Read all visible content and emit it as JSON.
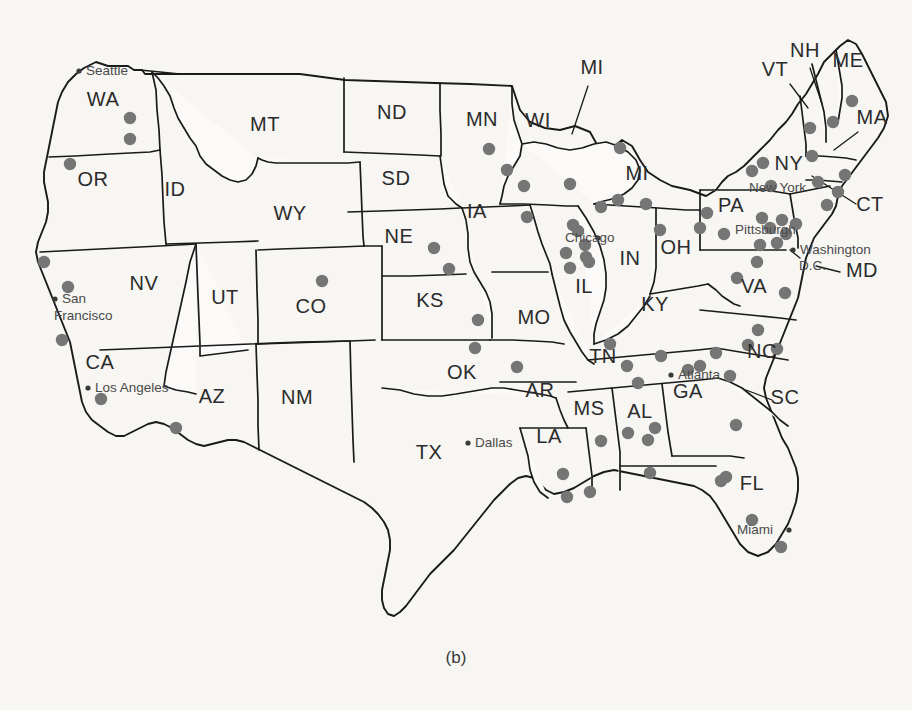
{
  "figure": {
    "caption": "(b)",
    "background_color": "#f7f6f3",
    "dot_color": "#757575",
    "outline_color": "#1a1a1a"
  },
  "map": {
    "title": "United States state map with sample site markers",
    "state_labels": [
      {
        "code": "WA",
        "x": 103,
        "y": 106
      },
      {
        "code": "OR",
        "x": 93,
        "y": 186
      },
      {
        "code": "ID",
        "x": 175,
        "y": 196
      },
      {
        "code": "MT",
        "x": 265,
        "y": 131
      },
      {
        "code": "ND",
        "x": 392,
        "y": 119
      },
      {
        "code": "SD",
        "x": 396,
        "y": 185
      },
      {
        "code": "NE",
        "x": 399,
        "y": 243
      },
      {
        "code": "WY",
        "x": 290,
        "y": 220
      },
      {
        "code": "CO",
        "x": 311,
        "y": 313
      },
      {
        "code": "UT",
        "x": 225,
        "y": 304
      },
      {
        "code": "NV",
        "x": 144,
        "y": 290
      },
      {
        "code": "CA",
        "x": 100,
        "y": 369
      },
      {
        "code": "AZ",
        "x": 212,
        "y": 403
      },
      {
        "code": "NM",
        "x": 297,
        "y": 404
      },
      {
        "code": "TX",
        "x": 429,
        "y": 459
      },
      {
        "code": "OK",
        "x": 462,
        "y": 379
      },
      {
        "code": "KS",
        "x": 430,
        "y": 307
      },
      {
        "code": "MN",
        "x": 482,
        "y": 126
      },
      {
        "code": "IA",
        "x": 477,
        "y": 218
      },
      {
        "code": "MO",
        "x": 534,
        "y": 324
      },
      {
        "code": "AR",
        "x": 540,
        "y": 397
      },
      {
        "code": "LA",
        "x": 549,
        "y": 443
      },
      {
        "code": "MS",
        "x": 589,
        "y": 415
      },
      {
        "code": "AL",
        "x": 640,
        "y": 418
      },
      {
        "code": "WI",
        "x": 538,
        "y": 127
      },
      {
        "code": "IL",
        "x": 584,
        "y": 293
      },
      {
        "code": "MI",
        "x": 592,
        "y": 74
      },
      {
        "code": "MI",
        "x": 637,
        "y": 180
      },
      {
        "code": "IN",
        "x": 630,
        "y": 265
      },
      {
        "code": "OH",
        "x": 676,
        "y": 254
      },
      {
        "code": "KY",
        "x": 655,
        "y": 311
      },
      {
        "code": "TN",
        "x": 603,
        "y": 363
      },
      {
        "code": "GA",
        "x": 688,
        "y": 398
      },
      {
        "code": "FL",
        "x": 752,
        "y": 490
      },
      {
        "code": "SC",
        "x": 785,
        "y": 404
      },
      {
        "code": "NC",
        "x": 762,
        "y": 358
      },
      {
        "code": "VA",
        "x": 754,
        "y": 293
      },
      {
        "code": "PA",
        "x": 731,
        "y": 212
      },
      {
        "code": "NY",
        "x": 789,
        "y": 170
      },
      {
        "code": "VT",
        "x": 775,
        "y": 76
      },
      {
        "code": "NH",
        "x": 805,
        "y": 57
      },
      {
        "code": "ME",
        "x": 848,
        "y": 67
      },
      {
        "code": "MA",
        "x": 872,
        "y": 124
      },
      {
        "code": "CT",
        "x": 870,
        "y": 211
      },
      {
        "code": "MD",
        "x": 862,
        "y": 277
      }
    ],
    "cities": [
      {
        "name": "Seattle",
        "label_x": 86,
        "label_y": 75,
        "anchor": "start",
        "dot_x": 79,
        "dot_y": 71
      },
      {
        "name": "San",
        "label_x": 62,
        "label_y": 303,
        "anchor": "start",
        "dot_x": 55,
        "dot_y": 299
      },
      {
        "name": "Francisco",
        "label_x": 54,
        "label_y": 320,
        "anchor": "start",
        "dot_x": null,
        "dot_y": null
      },
      {
        "name": "Los Angeles",
        "label_x": 95,
        "label_y": 392,
        "anchor": "start",
        "dot_x": 88,
        "dot_y": 388
      },
      {
        "name": "Dallas",
        "label_x": 475,
        "label_y": 447,
        "anchor": "start",
        "dot_x": 468,
        "dot_y": 443
      },
      {
        "name": "Chicago",
        "label_x": 565,
        "label_y": 242,
        "anchor": "start",
        "dot_x": 598,
        "dot_y": 238
      },
      {
        "name": "Atlanta",
        "label_x": 678,
        "label_y": 379,
        "anchor": "start",
        "dot_x": 671,
        "dot_y": 375
      },
      {
        "name": "Miami",
        "label_x": 737,
        "label_y": 534,
        "anchor": "start",
        "dot_x": 789,
        "dot_y": 530
      },
      {
        "name": "New York",
        "label_x": 749,
        "label_y": 192,
        "anchor": "start",
        "dot_x": null,
        "dot_y": null
      },
      {
        "name": "Pittsburgh",
        "label_x": 735,
        "label_y": 234,
        "anchor": "start",
        "dot_x": null,
        "dot_y": null
      },
      {
        "name": "Washington",
        "label_x": 800,
        "label_y": 254,
        "anchor": "start",
        "dot_x": 793,
        "dot_y": 250
      },
      {
        "name": "D.C.",
        "label_x": 799,
        "label_y": 270,
        "anchor": "start",
        "dot_x": null,
        "dot_y": null
      }
    ],
    "site_markers": [
      {
        "x": 130,
        "y": 118
      },
      {
        "x": 130,
        "y": 139
      },
      {
        "x": 70,
        "y": 164
      },
      {
        "x": 44,
        "y": 262
      },
      {
        "x": 68,
        "y": 287
      },
      {
        "x": 62,
        "y": 340
      },
      {
        "x": 101,
        "y": 399
      },
      {
        "x": 176,
        "y": 428
      },
      {
        "x": 322,
        "y": 281
      },
      {
        "x": 434,
        "y": 248
      },
      {
        "x": 449,
        "y": 269
      },
      {
        "x": 478,
        "y": 320
      },
      {
        "x": 475,
        "y": 348
      },
      {
        "x": 489,
        "y": 149
      },
      {
        "x": 507,
        "y": 170
      },
      {
        "x": 524,
        "y": 186
      },
      {
        "x": 527,
        "y": 217
      },
      {
        "x": 570,
        "y": 184
      },
      {
        "x": 573,
        "y": 225
      },
      {
        "x": 578,
        "y": 231
      },
      {
        "x": 566,
        "y": 253
      },
      {
        "x": 601,
        "y": 207
      },
      {
        "x": 585,
        "y": 245
      },
      {
        "x": 589,
        "y": 262
      },
      {
        "x": 570,
        "y": 268
      },
      {
        "x": 586,
        "y": 257
      },
      {
        "x": 620,
        "y": 148
      },
      {
        "x": 618,
        "y": 200
      },
      {
        "x": 646,
        "y": 204
      },
      {
        "x": 660,
        "y": 230
      },
      {
        "x": 700,
        "y": 228
      },
      {
        "x": 517,
        "y": 367
      },
      {
        "x": 563,
        "y": 474
      },
      {
        "x": 567,
        "y": 497
      },
      {
        "x": 590,
        "y": 492
      },
      {
        "x": 601,
        "y": 441
      },
      {
        "x": 610,
        "y": 344
      },
      {
        "x": 627,
        "y": 366
      },
      {
        "x": 638,
        "y": 383
      },
      {
        "x": 628,
        "y": 433
      },
      {
        "x": 648,
        "y": 440
      },
      {
        "x": 655,
        "y": 428
      },
      {
        "x": 661,
        "y": 356
      },
      {
        "x": 650,
        "y": 473
      },
      {
        "x": 688,
        "y": 370
      },
      {
        "x": 700,
        "y": 366
      },
      {
        "x": 716,
        "y": 353
      },
      {
        "x": 730,
        "y": 376
      },
      {
        "x": 736,
        "y": 425
      },
      {
        "x": 726,
        "y": 477
      },
      {
        "x": 721,
        "y": 481
      },
      {
        "x": 752,
        "y": 520
      },
      {
        "x": 781,
        "y": 547
      },
      {
        "x": 737,
        "y": 278
      },
      {
        "x": 757,
        "y": 262
      },
      {
        "x": 785,
        "y": 293
      },
      {
        "x": 758,
        "y": 330
      },
      {
        "x": 748,
        "y": 345
      },
      {
        "x": 777,
        "y": 349
      },
      {
        "x": 724,
        "y": 234
      },
      {
        "x": 707,
        "y": 213
      },
      {
        "x": 762,
        "y": 218
      },
      {
        "x": 770,
        "y": 228
      },
      {
        "x": 782,
        "y": 220
      },
      {
        "x": 786,
        "y": 234
      },
      {
        "x": 796,
        "y": 224
      },
      {
        "x": 777,
        "y": 243
      },
      {
        "x": 760,
        "y": 245
      },
      {
        "x": 771,
        "y": 186
      },
      {
        "x": 752,
        "y": 171
      },
      {
        "x": 763,
        "y": 163
      },
      {
        "x": 810,
        "y": 128
      },
      {
        "x": 812,
        "y": 156
      },
      {
        "x": 818,
        "y": 182
      },
      {
        "x": 833,
        "y": 122
      },
      {
        "x": 845,
        "y": 175
      },
      {
        "x": 852,
        "y": 101
      },
      {
        "x": 838,
        "y": 192
      },
      {
        "x": 827,
        "y": 205
      }
    ]
  }
}
